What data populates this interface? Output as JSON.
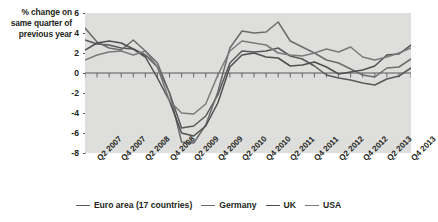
{
  "axis_title": {
    "line1": "% change on",
    "line2": "same quarter of",
    "line3": "previous year"
  },
  "legend": {
    "items": [
      {
        "label": "Euro area (17 countries)",
        "color": "#595959"
      },
      {
        "label": "Germany",
        "color": "#6b6b6b"
      },
      {
        "label": "UK",
        "color": "#4f4f4f"
      },
      {
        "label": "USA",
        "color": "#7a7a7a"
      }
    ]
  },
  "chart_data": {
    "type": "line",
    "title": "",
    "subtitle": "",
    "xlabel": "",
    "ylabel": "% change on same quarter of previous year",
    "ylim": [
      -8,
      6
    ],
    "yticks": [
      6,
      4,
      2,
      0,
      -2,
      -4,
      -6,
      -8
    ],
    "ytick_labels": [
      "6",
      "4",
      "2",
      "0",
      "-2",
      "-4",
      "-6",
      "-8"
    ],
    "grid": false,
    "plot_background": "#dededc",
    "legend_position": "bottom",
    "x": [
      "Q1 2007",
      "Q2 2007",
      "Q3 2007",
      "Q4 2007",
      "Q1 2008",
      "Q2 2008",
      "Q3 2008",
      "Q4 2008",
      "Q1 2009",
      "Q2 2009",
      "Q3 2009",
      "Q4 2009",
      "Q1 2010",
      "Q2 2010",
      "Q3 2010",
      "Q4 2010",
      "Q1 2011",
      "Q2 2011",
      "Q3 2011",
      "Q4 2011",
      "Q1 2012",
      "Q2 2012",
      "Q3 2012",
      "Q4 2012",
      "Q1 2013",
      "Q2 2013",
      "Q3 2013",
      "Q4 2013"
    ],
    "xtick_labels": [
      "Q2 2007",
      "Q4 2007",
      "Q2 2008",
      "Q4 2008",
      "Q2 2009",
      "Q4 2009",
      "Q2 2010",
      "Q4 2010",
      "Q2 2011",
      "Q4 2011",
      "Q2 2012",
      "Q4 2012",
      "Q2 2013",
      "Q4 2013"
    ],
    "series": [
      {
        "name": "Euro area (17 countries)",
        "color": "#595959",
        "values": [
          3.3,
          2.9,
          2.8,
          2.5,
          2.4,
          1.8,
          0.6,
          -2.0,
          -5.5,
          -5.3,
          -4.3,
          -2.2,
          1.0,
          2.2,
          2.1,
          2.2,
          2.5,
          1.7,
          1.4,
          0.7,
          -0.2,
          -0.5,
          -0.7,
          -1.0,
          -1.2,
          -0.6,
          -0.3,
          0.5
        ]
      },
      {
        "name": "Germany",
        "color": "#6b6b6b",
        "values": [
          4.5,
          3.1,
          2.5,
          2.3,
          3.3,
          2.2,
          1.0,
          -2.0,
          -6.9,
          -7.0,
          -5.2,
          -1.9,
          2.5,
          4.2,
          4.0,
          4.1,
          5.1,
          3.2,
          2.6,
          2.0,
          1.3,
          1.0,
          0.4,
          -0.2,
          -0.4,
          0.5,
          0.6,
          1.4
        ]
      },
      {
        "name": "UK",
        "color": "#4f4f4f",
        "values": [
          2.3,
          3.0,
          3.2,
          3.0,
          2.4,
          1.6,
          -0.5,
          -2.8,
          -6.0,
          -6.3,
          -5.3,
          -3.0,
          0.6,
          1.8,
          2.0,
          1.6,
          1.5,
          0.7,
          0.8,
          1.1,
          0.6,
          -0.1,
          0.1,
          0.3,
          0.7,
          1.8,
          1.9,
          2.8
        ]
      },
      {
        "name": "USA",
        "color": "#7a7a7a",
        "values": [
          1.3,
          1.8,
          2.1,
          2.2,
          1.8,
          2.2,
          0.6,
          -2.8,
          -4.0,
          -4.1,
          -3.1,
          -0.2,
          2.2,
          3.2,
          3.0,
          2.8,
          2.0,
          1.8,
          1.7,
          2.0,
          2.4,
          2.1,
          2.6,
          1.6,
          1.3,
          1.6,
          2.0,
          2.5
        ]
      }
    ]
  }
}
